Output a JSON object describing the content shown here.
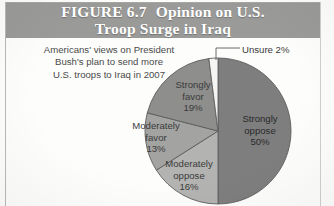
{
  "figure": {
    "number": "FIGURE 6.7",
    "title_line1": "Opinion on U.S.",
    "title_line2": "Troop Surge in Iraq",
    "banner_color": "#9a9a98"
  },
  "caption": {
    "line1": "Americans' views on President",
    "line2": "Bush's plan to send more",
    "line3": "U.S. troops to Iraq in 2007"
  },
  "labels": {
    "strongly_oppose": {
      "name_line1": "Strongly",
      "name_line2": "oppose",
      "pct": "50%"
    },
    "strongly_favor": {
      "name_line1": "Strongly",
      "name_line2": "favor",
      "pct": "19%"
    },
    "moderately_favor": {
      "name_line1": "Moderately",
      "name_line2": "favor",
      "pct": "13%"
    },
    "moderately_oppose": {
      "name_line1": "Moderately",
      "name_line2": "oppose",
      "pct": "16%"
    },
    "unsure": "Unsure 2%"
  },
  "chart_data": {
    "type": "pie",
    "subtitle": "Americans' views on President Bush's plan to send more U.S. troops to Iraq in 2007",
    "categories": [
      "Strongly oppose",
      "Moderately oppose",
      "Moderately favor",
      "Strongly favor",
      "Unsure"
    ],
    "values": [
      50,
      16,
      13,
      19,
      2
    ],
    "value_labels": [
      "50%",
      "16%",
      "13%",
      "19%",
      "2%"
    ],
    "unit": "percent",
    "total": 100,
    "start_angle_deg": 0,
    "direction": "clockwise",
    "colors": [
      "#7e7e7e",
      "#b3b3b1",
      "#a3a3a1",
      "#8e8e8c",
      "#f4f4f2"
    ],
    "legend": "none",
    "grid": false,
    "labels_inside": true,
    "callouts": [
      {
        "category": "Unsure",
        "text": "Unsure 2%",
        "leader": true
      }
    ]
  }
}
